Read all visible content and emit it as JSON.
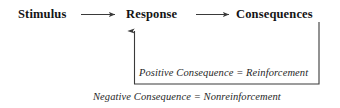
{
  "diagram": {
    "line_color": "#3a3a3a",
    "text_color": "#141414",
    "background": "#ffffff",
    "nodes": [
      {
        "id": "stimulus",
        "label": "Stimulus"
      },
      {
        "id": "response",
        "label": "Response"
      },
      {
        "id": "consequences",
        "label": "Consequences"
      }
    ],
    "connectors": [
      {
        "id": "stimulus-to-response",
        "from": "Stimulus",
        "to": "Response",
        "style": "arrow-right"
      },
      {
        "id": "response-to-consequences",
        "from": "Response",
        "to": "Consequences",
        "style": "arrow-right"
      },
      {
        "id": "consequences-feedback-to-response",
        "from": "Consequences",
        "to": "Response",
        "style": "feedback-loop-arrow-up"
      }
    ],
    "annotations": [
      {
        "id": "positive",
        "text": "Positive Consequence = Reinforcement"
      },
      {
        "id": "negative",
        "text": "Negative Consequence = Nonreinforcement"
      }
    ]
  }
}
